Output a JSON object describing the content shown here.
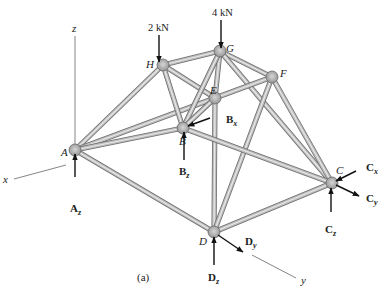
{
  "figure": {
    "caption": "(a)",
    "type": "space truss with support reactions"
  },
  "axes": {
    "x": "x",
    "y": "y",
    "z": "z"
  },
  "loads": [
    {
      "node": "H",
      "label": "2 kN"
    },
    {
      "node": "G",
      "label": "4 kN"
    }
  ],
  "nodes": [
    {
      "id": "A",
      "label": "A",
      "x": 75,
      "y": 150
    },
    {
      "id": "B",
      "label": "B",
      "x": 183,
      "y": 128
    },
    {
      "id": "C",
      "label": "C",
      "x": 332,
      "y": 183
    },
    {
      "id": "D",
      "label": "D",
      "x": 214,
      "y": 232
    },
    {
      "id": "E",
      "label": "E",
      "x": 215,
      "y": 98
    },
    {
      "id": "F",
      "label": "F",
      "x": 272,
      "y": 77
    },
    {
      "id": "G",
      "label": "G",
      "x": 220,
      "y": 51
    },
    {
      "id": "H",
      "label": "H",
      "x": 163,
      "y": 65
    }
  ],
  "members": [
    [
      "A",
      "H"
    ],
    [
      "A",
      "E"
    ],
    [
      "A",
      "B"
    ],
    [
      "A",
      "D"
    ],
    [
      "H",
      "G"
    ],
    [
      "H",
      "E"
    ],
    [
      "H",
      "B"
    ],
    [
      "G",
      "E"
    ],
    [
      "G",
      "F"
    ],
    [
      "G",
      "C"
    ],
    [
      "G",
      "B"
    ],
    [
      "E",
      "F"
    ],
    [
      "E",
      "D"
    ],
    [
      "E",
      "B"
    ],
    [
      "F",
      "D"
    ],
    [
      "F",
      "C"
    ],
    [
      "B",
      "C"
    ],
    [
      "D",
      "C"
    ]
  ],
  "reactions": [
    {
      "label": "A",
      "sub": "z"
    },
    {
      "label": "B",
      "sub": "x"
    },
    {
      "label": "B",
      "sub": "z"
    },
    {
      "label": "C",
      "sub": "x"
    },
    {
      "label": "C",
      "sub": "y"
    },
    {
      "label": "C",
      "sub": "z"
    },
    {
      "label": "D",
      "sub": "y"
    },
    {
      "label": "D",
      "sub": "z"
    }
  ]
}
